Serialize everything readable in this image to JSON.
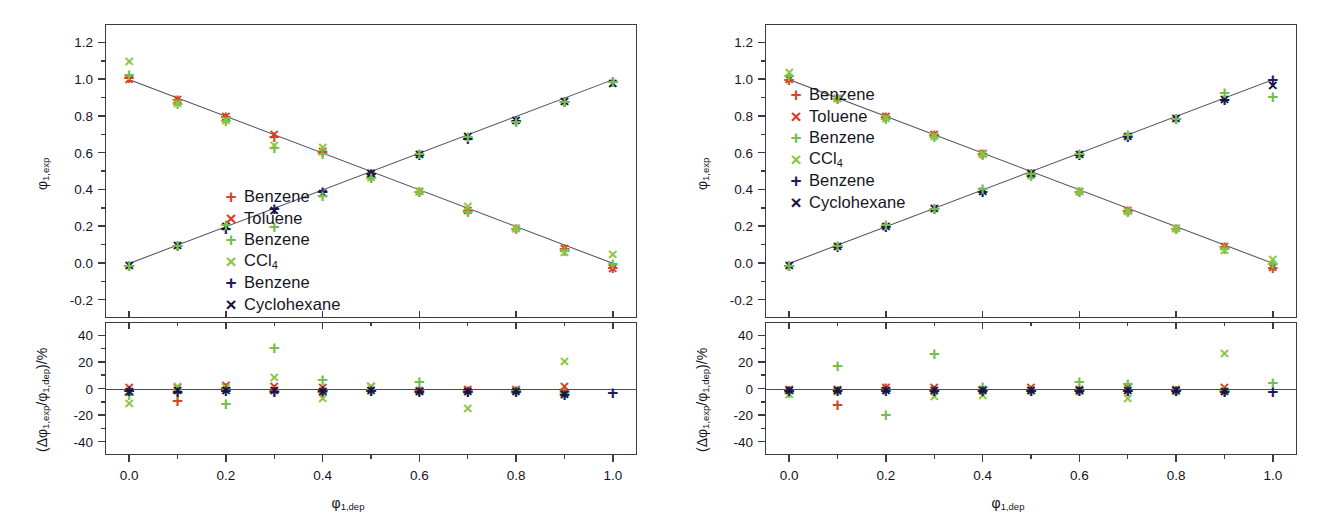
{
  "figure": {
    "panels": [
      "left",
      "right"
    ],
    "colors": {
      "benzene_plus_red": "#d1492b",
      "toluene_cross_red": "#dc3c1f",
      "benzene_plus_green": "#74bd4e",
      "ccl4_cross_green": "#8cc63e",
      "benzene_plus_navy": "#1d1d5c",
      "cyclohexane_cross_navy": "#15153f",
      "axis": "#3a3a4a",
      "fit_line": "#4b4b5e",
      "text": "#15151f"
    }
  },
  "chart_data": [
    {
      "type": "scatter",
      "panel": "left-top",
      "title": "",
      "xlabel": "φ₁,dep",
      "ylabel": "φ₁,exp",
      "xlim": [
        -0.05,
        1.05
      ],
      "ylim": [
        -0.3,
        1.3
      ],
      "xticks": [
        "0.0",
        "0.2",
        "0.4",
        "0.6",
        "0.8",
        "1.0"
      ],
      "xtick_values": [
        0.0,
        0.2,
        0.4,
        0.6,
        0.8,
        1.0
      ],
      "yticks": [
        "1.2",
        "1.0",
        "0.8",
        "0.6",
        "0.4",
        "0.2",
        "0.0",
        "-0.2"
      ],
      "ytick_values": [
        1.2,
        1.0,
        0.8,
        0.6,
        0.4,
        0.2,
        0.0,
        -0.2
      ],
      "grid": false,
      "legend_position": "center",
      "fit_lines": [
        {
          "name": "descending",
          "x": [
            0.0,
            1.0
          ],
          "y": [
            1.0,
            0.0
          ]
        },
        {
          "name": "ascending",
          "x": [
            0.0,
            1.0
          ],
          "y": [
            0.0,
            1.0
          ]
        }
      ],
      "x": [
        0.0,
        0.1,
        0.2,
        0.3,
        0.4,
        0.5,
        0.6,
        0.7,
        0.8,
        0.9,
        1.0
      ],
      "series": [
        {
          "name": "Benzene",
          "marker": "plus",
          "color": "#d1492b",
          "branch": "descending",
          "values": [
            1.01,
            0.89,
            0.8,
            0.69,
            0.61,
            0.49,
            0.39,
            0.29,
            0.19,
            0.08,
            -0.02
          ]
        },
        {
          "name": "Toluene",
          "marker": "cross",
          "color": "#dc3c1f",
          "branch": "descending",
          "values": [
            1.0,
            0.89,
            0.8,
            0.7,
            0.61,
            0.49,
            0.39,
            0.29,
            0.19,
            0.08,
            -0.03
          ]
        },
        {
          "name": "Benzene",
          "marker": "plus",
          "color": "#74bd4e",
          "branch": "descending",
          "values": [
            1.03,
            0.87,
            0.78,
            0.63,
            0.6,
            0.47,
            0.39,
            0.28,
            0.19,
            0.07,
            0.0
          ]
        },
        {
          "name": "CCl₄",
          "marker": "cross",
          "color": "#8cc63e",
          "branch": "descending",
          "values": [
            1.1,
            0.87,
            0.78,
            0.64,
            0.63,
            0.47,
            0.39,
            0.31,
            0.19,
            0.06,
            0.05
          ]
        },
        {
          "name": "Benzene",
          "marker": "plus",
          "color": "#1d1d5c",
          "branch": "ascending",
          "values": [
            -0.01,
            0.1,
            0.19,
            0.3,
            0.39,
            0.49,
            0.59,
            0.68,
            0.78,
            0.88,
            0.99
          ]
        },
        {
          "name": "Cyclohexane",
          "marker": "cross",
          "color": "#15153f",
          "branch": "ascending",
          "values": [
            -0.01,
            0.1,
            0.2,
            0.29,
            0.38,
            0.49,
            0.59,
            0.69,
            0.78,
            0.88,
            0.98
          ]
        },
        {
          "name": "Benzene-asc-green",
          "marker": "plus",
          "color": "#74bd4e",
          "branch": "ascending",
          "values": [
            -0.01,
            0.1,
            0.21,
            0.2,
            0.37,
            0.47,
            0.6,
            0.69,
            0.77,
            0.88,
            0.99
          ]
        }
      ]
    },
    {
      "type": "scatter",
      "panel": "left-bottom",
      "title": "",
      "xlabel": "φ₁,dep",
      "ylabel": "(Δφ₁,exp/φ₁,dep)/%",
      "xlim": [
        -0.05,
        1.05
      ],
      "ylim": [
        -50,
        50
      ],
      "xticks": [
        "0.0",
        "0.2",
        "0.4",
        "0.6",
        "0.8",
        "1.0"
      ],
      "xtick_values": [
        0.0,
        0.2,
        0.4,
        0.6,
        0.8,
        1.0
      ],
      "yticks": [
        "40",
        "20",
        "0",
        "-20",
        "-40"
      ],
      "ytick_values": [
        40,
        20,
        0,
        -20,
        -40
      ],
      "grid": false,
      "zero_line": true,
      "x": [
        0.0,
        0.1,
        0.2,
        0.3,
        0.4,
        0.5,
        0.6,
        0.7,
        0.8,
        0.9,
        1.0
      ],
      "series": [
        {
          "name": "Benzene",
          "marker": "plus",
          "color": "#d1492b",
          "values": [
            -1,
            -9,
            1,
            -1,
            -2,
            -1,
            -1,
            -1,
            -1,
            -1,
            null
          ]
        },
        {
          "name": "Toluene",
          "marker": "cross",
          "color": "#dc3c1f",
          "values": [
            1,
            1,
            3,
            2,
            1,
            2,
            -1,
            0,
            0,
            2,
            null
          ]
        },
        {
          "name": "Benzene",
          "marker": "plus",
          "color": "#74bd4e",
          "values": [
            -4,
            -3,
            -11,
            31,
            7,
            -1,
            6,
            -2,
            -1,
            -3,
            null
          ]
        },
        {
          "name": "CCl₄",
          "marker": "cross",
          "color": "#8cc63e",
          "values": [
            -11,
            2,
            1,
            9,
            -7,
            2,
            -2,
            -15,
            -1,
            21,
            null
          ]
        },
        {
          "name": "Benzene",
          "marker": "plus",
          "color": "#1d1d5c",
          "values": [
            -1,
            -2,
            -1,
            -2,
            -1,
            -1,
            -2,
            -2,
            -2,
            -4,
            -3
          ]
        },
        {
          "name": "Cyclohexane",
          "marker": "cross",
          "color": "#15153f",
          "values": [
            -2,
            -1,
            -1,
            -1,
            -2,
            -1,
            -2,
            -2,
            -2,
            -4,
            null
          ]
        }
      ]
    },
    {
      "type": "scatter",
      "panel": "right-top",
      "title": "",
      "xlabel": "φ₁,dep",
      "ylabel": "φ₁,exp",
      "xlim": [
        -0.05,
        1.05
      ],
      "ylim": [
        -0.3,
        1.3
      ],
      "xticks": [
        "0.0",
        "0.2",
        "0.4",
        "0.6",
        "0.8",
        "1.0"
      ],
      "xtick_values": [
        0.0,
        0.2,
        0.4,
        0.6,
        0.8,
        1.0
      ],
      "yticks": [
        "1.2",
        "1.0",
        "0.8",
        "0.6",
        "0.4",
        "0.2",
        "0.0",
        "-0.2"
      ],
      "ytick_values": [
        1.2,
        1.0,
        0.8,
        0.6,
        0.4,
        0.2,
        0.0,
        -0.2
      ],
      "grid": false,
      "legend_position": "upper-left",
      "fit_lines": [
        {
          "name": "descending",
          "x": [
            0.0,
            1.0
          ],
          "y": [
            1.0,
            0.0
          ]
        },
        {
          "name": "ascending",
          "x": [
            0.0,
            1.0
          ],
          "y": [
            0.0,
            1.0
          ]
        }
      ],
      "x": [
        0.0,
        0.1,
        0.2,
        0.3,
        0.4,
        0.5,
        0.6,
        0.7,
        0.8,
        0.9,
        1.0
      ],
      "series": [
        {
          "name": "Benzene",
          "marker": "plus",
          "color": "#d1492b",
          "branch": "descending",
          "values": [
            1.0,
            0.9,
            0.8,
            0.7,
            0.6,
            0.49,
            0.39,
            0.29,
            0.19,
            0.09,
            -0.02
          ]
        },
        {
          "name": "Toluene",
          "marker": "cross",
          "color": "#dc3c1f",
          "branch": "descending",
          "values": [
            1.0,
            0.9,
            0.8,
            0.7,
            0.6,
            0.49,
            0.39,
            0.29,
            0.19,
            0.09,
            -0.02
          ]
        },
        {
          "name": "Benzene",
          "marker": "plus",
          "color": "#74bd4e",
          "branch": "descending",
          "values": [
            1.02,
            0.9,
            0.79,
            0.69,
            0.59,
            0.48,
            0.39,
            0.28,
            0.19,
            0.08,
            0.0
          ]
        },
        {
          "name": "CCl₄",
          "marker": "cross",
          "color": "#8cc63e",
          "branch": "descending",
          "values": [
            1.04,
            0.9,
            0.79,
            0.69,
            0.59,
            0.48,
            0.39,
            0.28,
            0.19,
            0.07,
            0.02
          ]
        },
        {
          "name": "Benzene",
          "marker": "plus",
          "color": "#1d1d5c",
          "branch": "ascending",
          "values": [
            -0.01,
            0.09,
            0.2,
            0.3,
            0.39,
            0.49,
            0.59,
            0.69,
            0.79,
            0.89,
            1.0
          ]
        },
        {
          "name": "Cyclohexane",
          "marker": "cross",
          "color": "#15153f",
          "branch": "ascending",
          "values": [
            -0.01,
            0.09,
            0.2,
            0.3,
            0.39,
            0.49,
            0.59,
            0.69,
            0.79,
            0.89,
            0.97
          ]
        },
        {
          "name": "Benzene-asc-green",
          "marker": "plus",
          "color": "#74bd4e",
          "branch": "ascending",
          "values": [
            -0.01,
            0.1,
            0.21,
            0.3,
            0.41,
            0.49,
            0.6,
            0.7,
            0.79,
            0.93,
            0.91
          ]
        }
      ]
    },
    {
      "type": "scatter",
      "panel": "right-bottom",
      "title": "",
      "xlabel": "φ₁,dep",
      "ylabel": "(Δφ₁,exp/φ₁,dep)/%",
      "xlim": [
        -0.05,
        1.05
      ],
      "ylim": [
        -50,
        50
      ],
      "xticks": [
        "0.0",
        "0.2",
        "0.4",
        "0.6",
        "0.8",
        "1.0"
      ],
      "xtick_values": [
        0.0,
        0.2,
        0.4,
        0.6,
        0.8,
        1.0
      ],
      "yticks": [
        "40",
        "20",
        "0",
        "-20",
        "-40"
      ],
      "ytick_values": [
        40,
        20,
        0,
        -20,
        -40
      ],
      "grid": false,
      "zero_line": true,
      "x": [
        0.0,
        0.1,
        0.2,
        0.3,
        0.4,
        0.5,
        0.6,
        0.7,
        0.8,
        0.9,
        1.0
      ],
      "series": [
        {
          "name": "Benzene",
          "marker": "plus",
          "color": "#d1492b",
          "values": [
            -1,
            -12,
            1,
            -1,
            -1,
            -1,
            -1,
            -1,
            -1,
            -1,
            null
          ]
        },
        {
          "name": "Toluene",
          "marker": "cross",
          "color": "#dc3c1f",
          "values": [
            0,
            0,
            1,
            1,
            0,
            1,
            0,
            1,
            0,
            1,
            null
          ]
        },
        {
          "name": "Benzene",
          "marker": "plus",
          "color": "#74bd4e",
          "values": [
            -3,
            18,
            -19,
            27,
            2,
            -1,
            6,
            4,
            -1,
            -1,
            5
          ]
        },
        {
          "name": "CCl₄",
          "marker": "cross",
          "color": "#8cc63e",
          "values": [
            -4,
            -2,
            -1,
            -6,
            -5,
            -1,
            -2,
            -7,
            -2,
            27,
            null
          ]
        },
        {
          "name": "Benzene",
          "marker": "plus",
          "color": "#1d1d5c",
          "values": [
            -1,
            -1,
            -1,
            -1,
            -1,
            -1,
            -1,
            -1,
            -1,
            -2,
            -2
          ]
        },
        {
          "name": "Cyclohexane",
          "marker": "cross",
          "color": "#15153f",
          "values": [
            -1,
            -1,
            -1,
            -1,
            -1,
            -1,
            -1,
            -1,
            -1,
            -2,
            null
          ]
        }
      ]
    }
  ],
  "legend": {
    "entries": [
      {
        "label": "Benzene",
        "marker": "+",
        "color": "#d1492b"
      },
      {
        "label": "Toluene",
        "marker": "×",
        "color": "#dc3c1f"
      },
      {
        "label": "Benzene",
        "marker": "+",
        "color": "#74bd4e"
      },
      {
        "label": "CCl4",
        "marker": "×",
        "color": "#8cc63e",
        "sub": "4",
        "base": "CCl"
      },
      {
        "label": "Benzene",
        "marker": "+",
        "color": "#1d1d5c"
      },
      {
        "label": "Cyclohexane",
        "marker": "×",
        "color": "#15153f"
      }
    ]
  },
  "axes": {
    "y_top_label_base": "φ",
    "y_top_label_sub": "1,exp",
    "y_bot_label": "(Δφ",
    "y_bot_sub1": "1,exp",
    "y_bot_mid": "/φ",
    "y_bot_sub2": "1,dep",
    "y_bot_end": ")/%",
    "x_label_base": "φ",
    "x_label_sub": "1,dep"
  }
}
